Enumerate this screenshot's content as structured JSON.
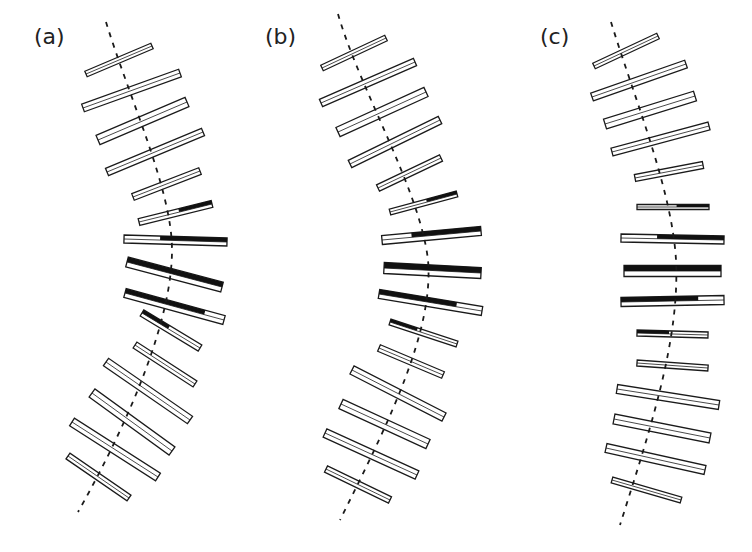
{
  "figure": {
    "colors": {
      "background": "#ffffff",
      "stroke": "#1a1a1a",
      "dark": "#111111"
    }
  },
  "panels": [
    {
      "label": "(a)",
      "label_pos": [
        34,
        44
      ],
      "axis": "M106,22 C130,100 172,190 172,250 C172,320 130,420 78,512",
      "bars": [
        {
          "x1": 86,
          "y1": 74,
          "x2": 152,
          "y2": 46,
          "w": 6,
          "dark": null
        },
        {
          "x1": 83,
          "y1": 108,
          "x2": 180,
          "y2": 73,
          "w": 8,
          "dark": null
        },
        {
          "x1": 98,
          "y1": 140,
          "x2": 187,
          "y2": 102,
          "w": 10,
          "dark": null
        },
        {
          "x1": 107,
          "y1": 172,
          "x2": 203,
          "y2": 132,
          "w": 8,
          "dark": null
        },
        {
          "x1": 133,
          "y1": 197,
          "x2": 200,
          "y2": 171,
          "w": 7,
          "dark": null
        },
        {
          "x1": 139,
          "y1": 222,
          "x2": 212,
          "y2": 204,
          "w": 7,
          "dark": [
            0.55,
            1
          ]
        },
        {
          "x1": 124,
          "y1": 239,
          "x2": 227,
          "y2": 242,
          "w": 8,
          "dark": [
            0.35,
            1
          ]
        },
        {
          "x1": 127,
          "y1": 262,
          "x2": 222,
          "y2": 287,
          "w": 10,
          "dark": [
            0,
            1
          ]
        },
        {
          "x1": 125,
          "y1": 293,
          "x2": 224,
          "y2": 320,
          "w": 9,
          "dark": [
            0,
            0.8
          ]
        },
        {
          "x1": 142,
          "y1": 313,
          "x2": 200,
          "y2": 348,
          "w": 7,
          "dark": [
            0,
            0.45
          ]
        },
        {
          "x1": 135,
          "y1": 345,
          "x2": 195,
          "y2": 384,
          "w": 7,
          "dark": null
        },
        {
          "x1": 106,
          "y1": 362,
          "x2": 190,
          "y2": 420,
          "w": 9,
          "dark": null
        },
        {
          "x1": 92,
          "y1": 393,
          "x2": 172,
          "y2": 451,
          "w": 10,
          "dark": null
        },
        {
          "x1": 72,
          "y1": 422,
          "x2": 158,
          "y2": 477,
          "w": 9,
          "dark": null
        },
        {
          "x1": 68,
          "y1": 456,
          "x2": 129,
          "y2": 498,
          "w": 7,
          "dark": null
        }
      ]
    },
    {
      "label": "(b)",
      "label_pos": [
        265,
        44
      ],
      "axis": "M338,14 C360,90 420,190 428,260 C434,330 390,420 340,520",
      "bars": [
        {
          "x1": 322,
          "y1": 68,
          "x2": 386,
          "y2": 38,
          "w": 6,
          "dark": null
        },
        {
          "x1": 321,
          "y1": 103,
          "x2": 415,
          "y2": 62,
          "w": 8,
          "dark": null
        },
        {
          "x1": 338,
          "y1": 132,
          "x2": 426,
          "y2": 92,
          "w": 10,
          "dark": null
        },
        {
          "x1": 350,
          "y1": 164,
          "x2": 440,
          "y2": 120,
          "w": 8,
          "dark": null
        },
        {
          "x1": 378,
          "y1": 188,
          "x2": 441,
          "y2": 158,
          "w": 7,
          "dark": null
        },
        {
          "x1": 390,
          "y1": 212,
          "x2": 457,
          "y2": 194,
          "w": 6,
          "dark": [
            0.55,
            1
          ]
        },
        {
          "x1": 382,
          "y1": 240,
          "x2": 481,
          "y2": 231,
          "w": 9,
          "dark": [
            0.3,
            1
          ]
        },
        {
          "x1": 384,
          "y1": 268,
          "x2": 481,
          "y2": 273,
          "w": 11,
          "dark": [
            0,
            1
          ]
        },
        {
          "x1": 379,
          "y1": 294,
          "x2": 482,
          "y2": 311,
          "w": 9,
          "dark": [
            0,
            0.75
          ]
        },
        {
          "x1": 390,
          "y1": 322,
          "x2": 457,
          "y2": 344,
          "w": 6,
          "dark": [
            0,
            0.4
          ]
        },
        {
          "x1": 379,
          "y1": 348,
          "x2": 443,
          "y2": 375,
          "w": 7,
          "dark": null
        },
        {
          "x1": 352,
          "y1": 370,
          "x2": 444,
          "y2": 417,
          "w": 9,
          "dark": null
        },
        {
          "x1": 341,
          "y1": 404,
          "x2": 428,
          "y2": 444,
          "w": 10,
          "dark": null
        },
        {
          "x1": 325,
          "y1": 433,
          "x2": 417,
          "y2": 475,
          "w": 9,
          "dark": null
        },
        {
          "x1": 326,
          "y1": 469,
          "x2": 390,
          "y2": 500,
          "w": 7,
          "dark": null
        }
      ]
    },
    {
      "label": "(c)",
      "label_pos": [
        540,
        44
      ],
      "axis": "M611,22 C635,100 672,190 676,260 C680,340 650,430 620,525",
      "bars": [
        {
          "x1": 594,
          "y1": 66,
          "x2": 658,
          "y2": 36,
          "w": 6,
          "dark": null
        },
        {
          "x1": 592,
          "y1": 97,
          "x2": 686,
          "y2": 64,
          "w": 8,
          "dark": null
        },
        {
          "x1": 605,
          "y1": 124,
          "x2": 695,
          "y2": 96,
          "w": 10,
          "dark": null
        },
        {
          "x1": 612,
          "y1": 152,
          "x2": 709,
          "y2": 126,
          "w": 8,
          "dark": null
        },
        {
          "x1": 635,
          "y1": 178,
          "x2": 703,
          "y2": 165,
          "w": 7,
          "dark": null
        },
        {
          "x1": 637,
          "y1": 207,
          "x2": 709,
          "y2": 207,
          "w": 5,
          "dark": [
            0.55,
            1
          ]
        },
        {
          "x1": 621,
          "y1": 238,
          "x2": 724,
          "y2": 240,
          "w": 8,
          "dark": [
            0.35,
            1
          ]
        },
        {
          "x1": 624,
          "y1": 271,
          "x2": 721,
          "y2": 271,
          "w": 11,
          "dark": [
            0,
            1
          ]
        },
        {
          "x1": 621,
          "y1": 302,
          "x2": 724,
          "y2": 300,
          "w": 9,
          "dark": [
            0,
            0.75
          ]
        },
        {
          "x1": 637,
          "y1": 333,
          "x2": 708,
          "y2": 335,
          "w": 6,
          "dark": [
            0,
            0.45
          ]
        },
        {
          "x1": 637,
          "y1": 363,
          "x2": 708,
          "y2": 368,
          "w": 6,
          "dark": null
        },
        {
          "x1": 617,
          "y1": 389,
          "x2": 719,
          "y2": 405,
          "w": 9,
          "dark": null
        },
        {
          "x1": 614,
          "y1": 419,
          "x2": 710,
          "y2": 438,
          "w": 10,
          "dark": null
        },
        {
          "x1": 606,
          "y1": 448,
          "x2": 705,
          "y2": 470,
          "w": 9,
          "dark": null
        },
        {
          "x1": 612,
          "y1": 480,
          "x2": 681,
          "y2": 500,
          "w": 6,
          "dark": null
        }
      ]
    }
  ]
}
